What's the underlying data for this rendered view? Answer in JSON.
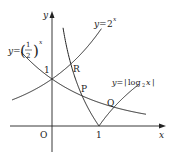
{
  "diagram": {
    "type": "function-graph",
    "axes": {
      "x_label": "x",
      "y_label": "y",
      "origin_label": "O",
      "tick_x": "1",
      "tick_y": "1"
    },
    "curves": [
      {
        "name": "exp2",
        "label_lhs": "y=",
        "label_base": "2",
        "label_exp": "x"
      },
      {
        "name": "half_pow",
        "label_lhs": "y=",
        "label_num": "1",
        "label_den": "2",
        "label_exp": "x"
      },
      {
        "name": "abs_log",
        "label_lhs": "y=",
        "label_func": "log",
        "label_sub": "2",
        "label_arg": "x"
      }
    ],
    "points": [
      {
        "name": "R",
        "label": "R"
      },
      {
        "name": "P",
        "label": "P"
      },
      {
        "name": "Q",
        "label": "Q"
      }
    ],
    "stroke_color": "#222222"
  }
}
